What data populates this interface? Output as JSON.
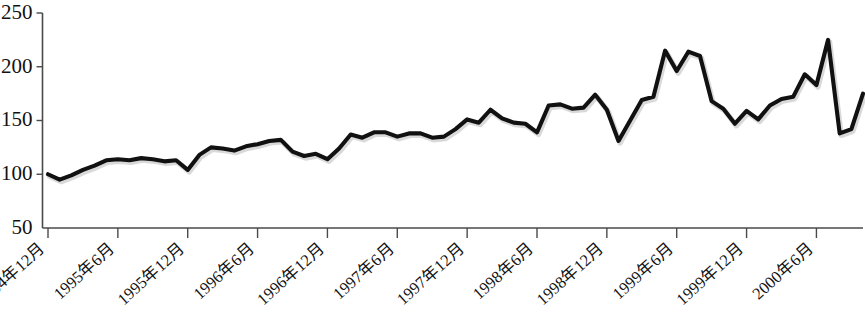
{
  "chart_data": {
    "type": "line",
    "title": "",
    "subtitle": "",
    "xlabel": "",
    "ylabel": "",
    "ylim": [
      50,
      250
    ],
    "yticks": [
      50,
      100,
      150,
      200,
      250
    ],
    "grid": false,
    "legend": null,
    "xtick_labels": [
      "1994年12月",
      "1995年6月",
      "1995年12月",
      "1996年6月",
      "1996年12月",
      "1997年6月",
      "1997年12月",
      "1998年6月",
      "1998年12月",
      "1999年6月",
      "1999年12月",
      "2000年6月"
    ],
    "xtick_indices": [
      0,
      6,
      12,
      18,
      24,
      30,
      36,
      42,
      48,
      54,
      60,
      66
    ],
    "x": [
      "1994-12",
      "1995-01",
      "1995-02",
      "1995-03",
      "1995-04",
      "1995-05",
      "1995-06",
      "1995-07",
      "1995-08",
      "1995-09",
      "1995-10",
      "1995-11",
      "1995-12",
      "1996-01",
      "1996-02",
      "1996-03",
      "1996-04",
      "1996-05",
      "1996-06",
      "1996-07",
      "1996-08",
      "1996-09",
      "1996-10",
      "1996-11",
      "1996-12",
      "1997-01",
      "1997-02",
      "1997-03",
      "1997-04",
      "1997-05",
      "1997-06",
      "1997-07",
      "1997-08",
      "1997-09",
      "1997-10",
      "1997-11",
      "1997-12",
      "1998-01",
      "1998-02",
      "1998-03",
      "1998-04",
      "1998-05",
      "1998-06",
      "1998-07",
      "1998-08",
      "1998-09",
      "1998-10",
      "1998-11",
      "1998-12",
      "1999-01",
      "1999-02",
      "1999-03",
      "1999-04",
      "1999-05",
      "1999-06",
      "1999-07",
      "1999-08",
      "1999-09",
      "1999-10",
      "1999-11",
      "1999-12",
      "2000-01",
      "2000-02",
      "2000-03",
      "2000-04",
      "2000-05",
      "2000-06",
      "2000-07",
      "2000-08"
    ],
    "values": [
      100,
      95,
      99,
      104,
      108,
      113,
      114,
      113,
      115,
      114,
      112,
      113,
      104,
      118,
      125,
      124,
      122,
      126,
      128,
      131,
      132,
      121,
      117,
      119,
      114,
      124,
      137,
      134,
      139,
      139,
      135,
      138,
      138,
      134,
      135,
      142,
      151,
      148,
      160,
      152,
      148,
      147,
      139,
      164,
      165,
      161,
      162,
      174,
      160,
      131,
      150,
      169,
      172,
      215,
      196,
      214,
      210,
      168,
      161,
      147,
      159,
      151,
      164,
      170,
      172,
      193,
      183,
      225,
      138
    ],
    "values_tail": [
      142,
      175
    ],
    "peaks": [
      {
        "label": "1999-05",
        "value": 215
      },
      {
        "label": "1999-07",
        "value": 214
      },
      {
        "label": "2000-07",
        "value": 225
      }
    ],
    "troughs": [
      {
        "label": "1995-01",
        "value": 95
      },
      {
        "label": "1999-01",
        "value": 131
      },
      {
        "label": "2000-08",
        "value": 138
      }
    ],
    "series_color": "#111111",
    "axis_color": "#4a4a4a",
    "background_color": "#ffffff"
  }
}
